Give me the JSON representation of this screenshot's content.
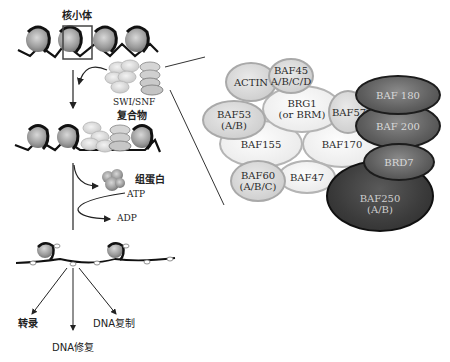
{
  "left_panel": {
    "nucleosome_label": "核小体",
    "complex_label_line1": "SWI/SNF",
    "complex_label_line2": "复合物",
    "histone_label": "组蛋白",
    "atp_label": "ATP",
    "adp_label": "ADP",
    "outcomes": {
      "transcription": "转录",
      "dna_repair": "DNA修复",
      "dna_replication": "DNA复制"
    }
  },
  "complex_subunits": {
    "actin": "ACTIN",
    "baf45_line1": "BAF45",
    "baf45_line2": "A/B/C/D",
    "baf53_line1": "BAF53",
    "baf53_line2": "(A/B)",
    "brg1_line1": "BRG1",
    "brg1_line2": "(or BRM)",
    "baf57": "BAF57",
    "baf155": "BAF155",
    "baf170": "BAF170",
    "baf60_line1": "BAF60",
    "baf60_line2": "(A/B/C)",
    "baf47": "BAF47",
    "baf180": "BAF 180",
    "baf200": "BAF 200",
    "brd7": "BRD7",
    "baf250_line1": "BAF250",
    "baf250_line2": "(A/B)"
  },
  "colors": {
    "light_subunit": "#ececec",
    "mid_subunit": "#cfcfcf",
    "dark_subunit": "#5e5e5e",
    "darker_subunit": "#3b3b3b",
    "line": "#333333"
  }
}
